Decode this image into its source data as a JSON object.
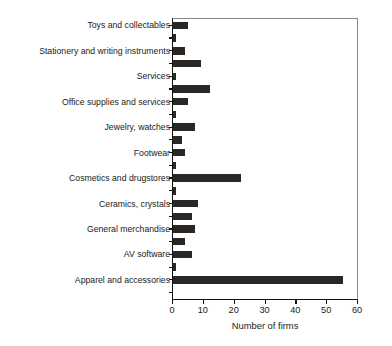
{
  "chart_data": {
    "type": "bar",
    "orientation": "horizontal",
    "title": "",
    "xlabel": "Number of firms",
    "ylabel": "",
    "xlim": [
      0,
      60
    ],
    "xticks": [
      0,
      10,
      20,
      30,
      40,
      50,
      60
    ],
    "xtick_labels": [
      "0",
      "10",
      "20",
      "30",
      "40",
      "50",
      "60"
    ],
    "grid": false,
    "legend": null,
    "categories": [
      "Toys and collectables",
      "",
      "Stationery and writing instruments",
      "",
      "Services",
      "",
      "Office supplies and services",
      "",
      "Jewelry, watches",
      "",
      "Footwear",
      "",
      "Cosmetics and drugstores",
      "",
      "Ceramics, crystals",
      "",
      "General merchandise",
      "",
      "AV software",
      "",
      "Apparel and accessories",
      ""
    ],
    "values": [
      5,
      1,
      4,
      9,
      1,
      12,
      5,
      1,
      7,
      3,
      4,
      1,
      22,
      1,
      8,
      6,
      7,
      4,
      6,
      1,
      55,
      0
    ],
    "labeled_categories": [
      "Toys and collectables",
      "Stationery and writing instruments",
      "Services",
      "Office supplies and services",
      "Jewelry, watches",
      "Footwear",
      "Cosmetics and drugstores",
      "Ceramics, crystals",
      "General merchandise",
      "AV software",
      "Apparel and accessories"
    ],
    "bar_color": "#2b2725",
    "axis_color": "#111111",
    "background_color": "#ffffff"
  },
  "axis": {
    "x_title": "Number of firms",
    "tick_labels": [
      "0",
      "10",
      "20",
      "30",
      "40",
      "50",
      "60"
    ]
  },
  "labels": {
    "l0": "Toys and collectables",
    "l1": "Stationery and writing instruments",
    "l2": "Services",
    "l3": "Office supplies and services",
    "l4": "Jewelry, watches",
    "l5": "Footwear",
    "l6": "Cosmetics and drugstores",
    "l7": "Ceramics, crystals",
    "l8": "General merchandise",
    "l9": "AV software",
    "l10": "Apparel and accessories"
  }
}
